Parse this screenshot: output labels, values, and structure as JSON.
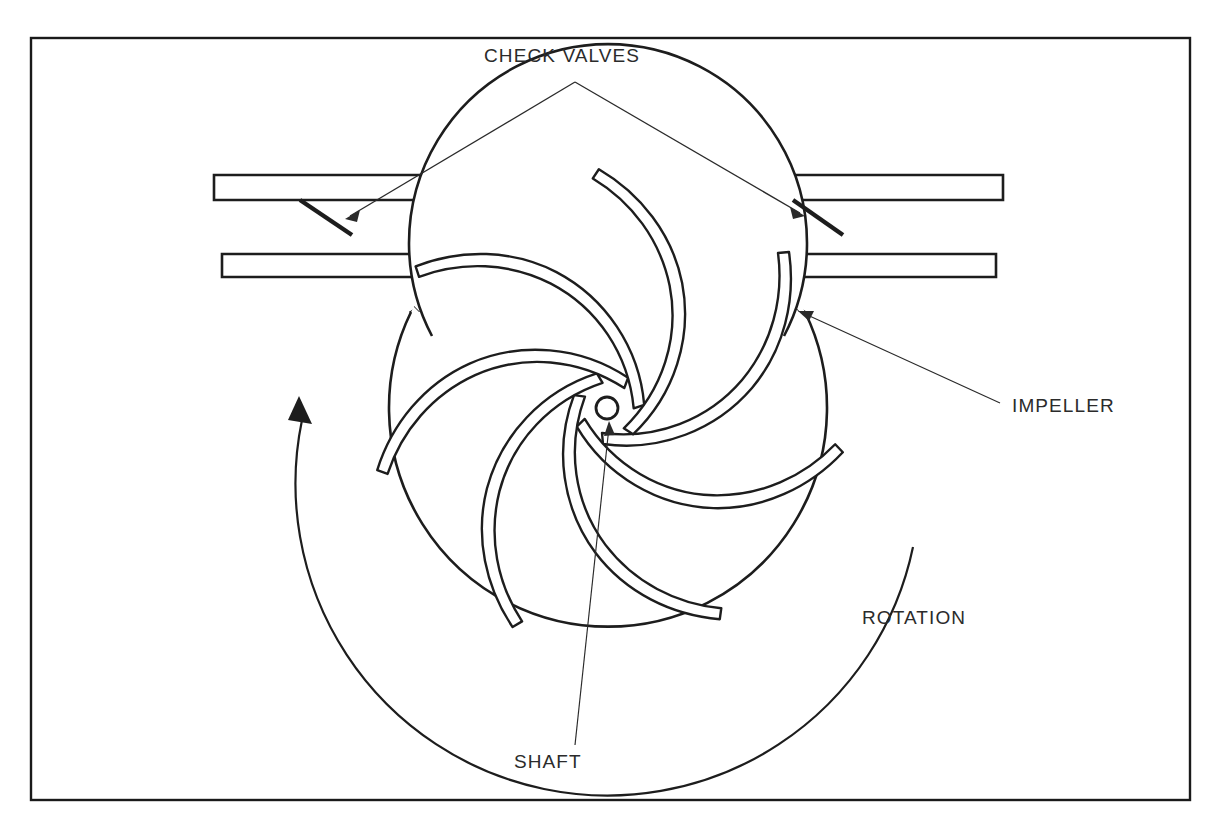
{
  "figure": {
    "background_color": "#ffffff",
    "line_color": "#1d1d1d",
    "frame": {
      "x": 31,
      "y": 38,
      "width": 1159,
      "height": 762,
      "stroke": "#1a1a1a"
    }
  },
  "labels": {
    "check_valves": {
      "text": "CHECK VALVES",
      "x": 484,
      "y": 62
    },
    "impeller": {
      "text": "IMPELLER",
      "x": 1012,
      "y": 412
    },
    "rotation": {
      "text": "ROTATION",
      "x": 862,
      "y": 624
    },
    "shaft": {
      "text": "SHAFT",
      "x": 514,
      "y": 768
    }
  },
  "components": {
    "upper_pipe": {
      "name": "discharge-pipe-wall",
      "left_x": 214,
      "right_x": 1003,
      "top_y": 175,
      "bottom_y": 200,
      "hatched": true
    },
    "lower_pipe_left": {
      "name": "suction-pipe-wall-left",
      "left_x": 222,
      "right_x": 470,
      "top_y": 254,
      "bottom_y": 277,
      "hatched": true
    },
    "lower_pipe_right": {
      "name": "suction-pipe-wall-right",
      "left_x": 744,
      "right_x": 996,
      "top_y": 254,
      "bottom_y": 277,
      "hatched": true
    },
    "casing": {
      "name": "pump-casing-ring",
      "center_x": 608,
      "center_y": 408,
      "outer_radius": 219,
      "inner_radius": 199,
      "hatched": true
    },
    "shaft": {
      "name": "shaft-circle",
      "center_x": 607,
      "center_y": 408,
      "radius": 11
    },
    "impeller_vanes": {
      "name": "impeller-vanes",
      "count": 7,
      "hub_radius": 36,
      "tip_radius": 196,
      "thickness": 11,
      "sweep": "backswept",
      "start_angles_deg": [
        97,
        149,
        201,
        252,
        304,
        355,
        46
      ]
    },
    "check_valve_flaps": [
      {
        "name": "check-valve-flap-left",
        "x1": 300,
        "y1": 200,
        "x2": 352,
        "y2": 235
      },
      {
        "name": "check-valve-flap-right",
        "x1": 793,
        "y1": 200,
        "x2": 843,
        "y2": 235
      }
    ],
    "rotation_arrow": {
      "name": "rotation-arrow",
      "center_x": 608,
      "center_y": 408,
      "radius": 305,
      "direction": "counterclockwise",
      "start_angle_deg": 63,
      "end_angle_deg": 188
    }
  },
  "leaders": {
    "check_valves_apex": {
      "x": 575,
      "y": 82
    },
    "check_valves_left_end": {
      "x": 345,
      "y": 217
    },
    "check_valves_right_end": {
      "x": 805,
      "y": 214
    },
    "impeller_leader": {
      "x1": 1000,
      "y1": 403,
      "x2": 800,
      "y2": 312
    },
    "shaft_leader": {
      "x1": 575,
      "y1": 745,
      "x2": 609,
      "y2": 424
    }
  }
}
